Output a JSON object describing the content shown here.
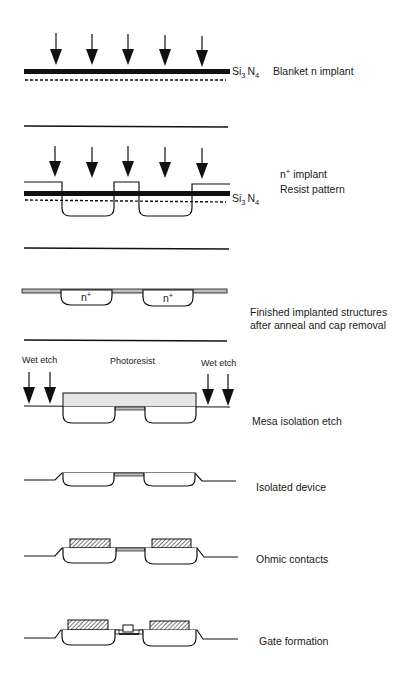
{
  "figure": {
    "steps": [
      {
        "id": "blanket",
        "label": "Blanket n implant",
        "material": {
          "base": "Si",
          "sub1": "3",
          "mid": "N",
          "sub2": "4"
        }
      },
      {
        "id": "nplus",
        "label_line1_pre": "n",
        "label_line1_sup": "+",
        "label_line1_post": " implant",
        "label_line2": "Resist pattern",
        "material": {
          "base": "Si",
          "sub1": "3",
          "mid": "N",
          "sub2": "4"
        }
      },
      {
        "id": "finished",
        "label_line1": "Finished implanted structures",
        "label_line2": "after anneal and cap removal",
        "region_label": "n",
        "region_sup": "+"
      },
      {
        "id": "mesa",
        "label": "Mesa isolation etch",
        "left_note": "Wet etch",
        "center_note": "Photoresist",
        "right_note": "Wet etch"
      },
      {
        "id": "isolated",
        "label": "Isolated device"
      },
      {
        "id": "ohmic",
        "label": "Ohmic contacts"
      },
      {
        "id": "gate",
        "label": "Gate formation"
      }
    ]
  },
  "colors": {
    "ink": "#111111",
    "resist_fill": "#e6e6e6",
    "background": "#ffffff"
  }
}
